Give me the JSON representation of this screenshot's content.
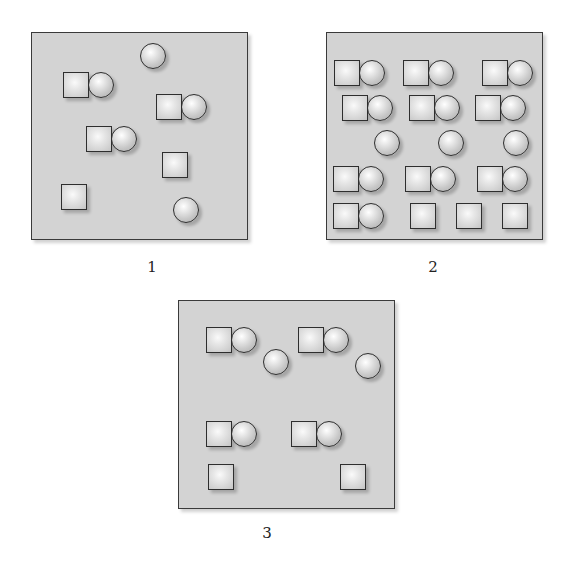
{
  "figure": {
    "colors": {
      "panel_background": "#d3d3d3",
      "panel_border": "#3a3a3a",
      "shape_outline": "#2e2e2e",
      "shape_fill": "#e6e6e6"
    },
    "shape_size": 26,
    "panels": [
      {
        "label": "1",
        "box": {
          "x": 31,
          "y": 32,
          "w": 217,
          "h": 208
        },
        "label_pos": {
          "x": 152,
          "y": 258
        },
        "counts": {
          "pairs": 3,
          "lone_circles": 2,
          "lone_squares": 2
        },
        "shapes": [
          {
            "type": "circle",
            "x": 140,
            "y": 43
          },
          {
            "type": "square",
            "x": 63,
            "y": 72
          },
          {
            "type": "circle",
            "x": 88,
            "y": 72
          },
          {
            "type": "square",
            "x": 156,
            "y": 94
          },
          {
            "type": "circle",
            "x": 181,
            "y": 94
          },
          {
            "type": "square",
            "x": 86,
            "y": 126
          },
          {
            "type": "circle",
            "x": 111,
            "y": 126
          },
          {
            "type": "square",
            "x": 162,
            "y": 152
          },
          {
            "type": "square",
            "x": 61,
            "y": 184
          },
          {
            "type": "circle",
            "x": 173,
            "y": 197
          }
        ]
      },
      {
        "label": "2",
        "box": {
          "x": 326,
          "y": 32,
          "w": 217,
          "h": 208
        },
        "label_pos": {
          "x": 433,
          "y": 258
        },
        "counts": {
          "pairs": 10,
          "lone_circles": 3,
          "lone_squares": 3
        },
        "shapes": [
          {
            "type": "square",
            "x": 334,
            "y": 60
          },
          {
            "type": "circle",
            "x": 359,
            "y": 60
          },
          {
            "type": "square",
            "x": 403,
            "y": 60
          },
          {
            "type": "circle",
            "x": 428,
            "y": 60
          },
          {
            "type": "square",
            "x": 482,
            "y": 60
          },
          {
            "type": "circle",
            "x": 507,
            "y": 60
          },
          {
            "type": "square",
            "x": 342,
            "y": 95
          },
          {
            "type": "circle",
            "x": 367,
            "y": 95
          },
          {
            "type": "square",
            "x": 409,
            "y": 95
          },
          {
            "type": "circle",
            "x": 434,
            "y": 95
          },
          {
            "type": "square",
            "x": 475,
            "y": 95
          },
          {
            "type": "circle",
            "x": 500,
            "y": 95
          },
          {
            "type": "circle",
            "x": 374,
            "y": 130
          },
          {
            "type": "circle",
            "x": 438,
            "y": 130
          },
          {
            "type": "circle",
            "x": 503,
            "y": 130
          },
          {
            "type": "square",
            "x": 333,
            "y": 166
          },
          {
            "type": "circle",
            "x": 358,
            "y": 166
          },
          {
            "type": "square",
            "x": 405,
            "y": 166
          },
          {
            "type": "circle",
            "x": 430,
            "y": 166
          },
          {
            "type": "square",
            "x": 477,
            "y": 166
          },
          {
            "type": "circle",
            "x": 502,
            "y": 166
          },
          {
            "type": "square",
            "x": 333,
            "y": 203
          },
          {
            "type": "circle",
            "x": 358,
            "y": 203
          },
          {
            "type": "square",
            "x": 410,
            "y": 203
          },
          {
            "type": "square",
            "x": 456,
            "y": 203
          },
          {
            "type": "square",
            "x": 502,
            "y": 203
          }
        ]
      },
      {
        "label": "3",
        "box": {
          "x": 178,
          "y": 300,
          "w": 217,
          "h": 209
        },
        "label_pos": {
          "x": 267,
          "y": 524
        },
        "counts": {
          "pairs": 4,
          "lone_circles": 2,
          "lone_squares": 2
        },
        "shapes": [
          {
            "type": "square",
            "x": 206,
            "y": 327
          },
          {
            "type": "circle",
            "x": 231,
            "y": 327
          },
          {
            "type": "circle",
            "x": 263,
            "y": 349
          },
          {
            "type": "square",
            "x": 298,
            "y": 327
          },
          {
            "type": "circle",
            "x": 323,
            "y": 327
          },
          {
            "type": "circle",
            "x": 355,
            "y": 353
          },
          {
            "type": "square",
            "x": 206,
            "y": 421
          },
          {
            "type": "circle",
            "x": 231,
            "y": 421
          },
          {
            "type": "square",
            "x": 291,
            "y": 421
          },
          {
            "type": "circle",
            "x": 316,
            "y": 421
          },
          {
            "type": "square",
            "x": 208,
            "y": 464
          },
          {
            "type": "square",
            "x": 340,
            "y": 464
          }
        ]
      }
    ]
  }
}
